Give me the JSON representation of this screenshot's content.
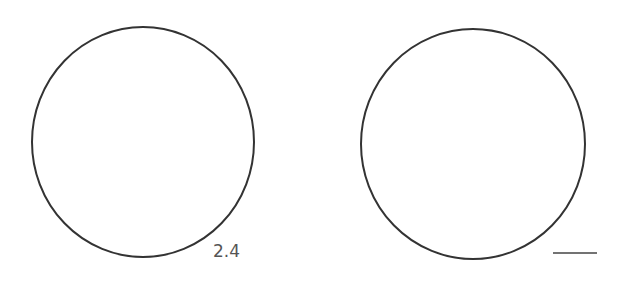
{
  "diagram": {
    "stroke_color": "#333333",
    "label_color": "#555555",
    "shapes": [
      {
        "type": "circle",
        "name": "left-circle",
        "cx": 143,
        "cy": 142,
        "rx": 111,
        "ry": 115
      },
      {
        "type": "circle",
        "name": "right-circle",
        "cx": 473,
        "cy": 144,
        "rx": 112,
        "ry": 115
      }
    ],
    "labels": [
      {
        "name": "left-circle-label",
        "text": "2.4",
        "x": 213,
        "y": 257
      }
    ],
    "blank_line": {
      "name": "right-circle-answer-blank",
      "x1": 553,
      "y1": 253,
      "x2": 597,
      "y2": 253
    }
  }
}
